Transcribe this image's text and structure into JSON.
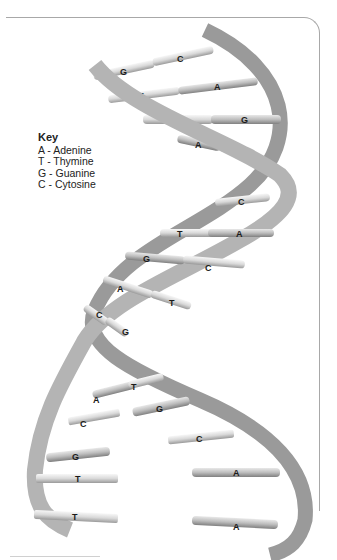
{
  "key": {
    "title": "Key",
    "items": [
      {
        "code": "A",
        "name": "Adenine",
        "label": "A - Adenine"
      },
      {
        "code": "T",
        "name": "Thymine",
        "label": "T - Thymine"
      },
      {
        "code": "G",
        "name": "Guanine",
        "label": "G - Guanine"
      },
      {
        "code": "C",
        "name": "Cytosine",
        "label": "C - Cytosine"
      }
    ]
  },
  "base_pairs": [
    {
      "left": "G",
      "right": "C"
    },
    {
      "left": "T",
      "right": "A"
    },
    {
      "left": "C",
      "right": "G"
    },
    {
      "left": "A",
      "right": "T"
    },
    {
      "left": "",
      "right": "C"
    },
    {
      "left": "T",
      "right": "A"
    },
    {
      "left": "G",
      "right": "C"
    },
    {
      "left": "A",
      "right": "T"
    },
    {
      "left": "C",
      "right": "G"
    },
    {
      "left": "A",
      "right": "T"
    }
  ],
  "unzipped_pairs": [
    {
      "left": "C",
      "right": "G"
    },
    {
      "left": "G",
      "right": "C"
    },
    {
      "left": "T",
      "right": "A"
    },
    {
      "left": "T",
      "right": "A"
    }
  ],
  "labels": {
    "r1l": "G",
    "r1r": "C",
    "r2l": "T",
    "r2r": "A",
    "r3l": "C",
    "r3r": "G",
    "r4l": "A",
    "r4r": "T",
    "r5r": "C",
    "r6l": "T",
    "r6r": "A",
    "r7l": "G",
    "r7r": "C",
    "r8l": "A",
    "r8r": "T",
    "r9l": "C",
    "r9r": "G",
    "r10l": "A",
    "r10r": "T",
    "u1l": "C",
    "u1r": "G",
    "u2l": "G",
    "u2r": "C",
    "u3l": "T",
    "u3r": "A",
    "u4l": "T",
    "u4r": "A"
  },
  "colors": {
    "strand": "#a9a9a9",
    "strand_dark": "#7d7d7d",
    "rung_light": "#e4e4e4",
    "rung_dark": "#b9b9b9",
    "frame": "#a8a8a8"
  }
}
